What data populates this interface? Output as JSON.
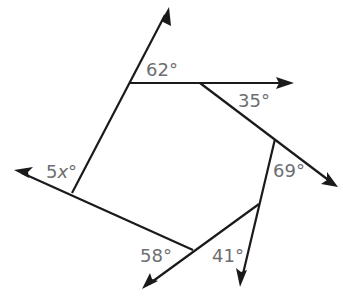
{
  "figure": {
    "type": "polygon-exterior-angles",
    "sides": 6,
    "colors": {
      "line": "#1a1a1a",
      "label": "#6d6e71",
      "background": "#ffffff"
    },
    "vertices": [
      {
        "id": "A",
        "x": 130,
        "y": 83
      },
      {
        "id": "B",
        "x": 200,
        "y": 83
      },
      {
        "id": "C",
        "x": 275,
        "y": 139
      },
      {
        "id": "D",
        "x": 259,
        "y": 204
      },
      {
        "id": "E",
        "x": 193,
        "y": 250
      },
      {
        "id": "F",
        "x": 72,
        "y": 193
      }
    ],
    "rays": [
      {
        "from": "F",
        "via": "A",
        "tip": [
          169,
          7
        ]
      },
      {
        "from": "A",
        "via": "B",
        "tip": [
          294,
          83
        ]
      },
      {
        "from": "B",
        "via": "C",
        "tip": [
          338,
          187
        ]
      },
      {
        "from": "C",
        "via": "D",
        "tip": [
          240,
          287
        ]
      },
      {
        "from": "D",
        "via": "E",
        "tip": [
          142,
          289
        ]
      },
      {
        "from": "E",
        "via": "F",
        "tip": [
          14,
          170
        ]
      }
    ],
    "angles": [
      {
        "vertex": "A",
        "value": "62°",
        "number": "62",
        "unit": "°"
      },
      {
        "vertex": "B",
        "value": "35°",
        "number": "35",
        "unit": "°"
      },
      {
        "vertex": "C",
        "value": "69°",
        "number": "69",
        "unit": "°"
      },
      {
        "vertex": "D",
        "value": "41°",
        "number": "41",
        "unit": "°"
      },
      {
        "vertex": "E",
        "value": "58°",
        "number": "58",
        "unit": "°"
      },
      {
        "vertex": "F",
        "value": "5x°",
        "coefficient": "5",
        "variable": "x",
        "unit": "°"
      }
    ]
  }
}
